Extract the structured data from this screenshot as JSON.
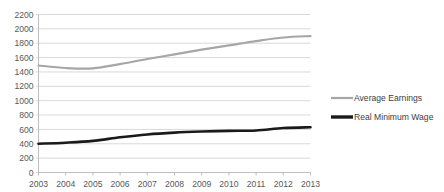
{
  "chart_data": {
    "type": "line",
    "title": "",
    "subtitle": "",
    "xlabel": "",
    "ylabel": "",
    "x": [
      2003,
      2004,
      2005,
      2006,
      2007,
      2008,
      2009,
      2010,
      2011,
      2012,
      2013
    ],
    "categories": [
      "2003",
      "2004",
      "2005",
      "2006",
      "2007",
      "2008",
      "2009",
      "2010",
      "2011",
      "2012",
      "2013"
    ],
    "series": [
      {
        "name": "Average Earnings",
        "color": "#a6a6a6",
        "values": [
          1490,
          1455,
          1450,
          1510,
          1580,
          1645,
          1710,
          1770,
          1830,
          1880,
          1900
        ]
      },
      {
        "name": "Real Minimum Wage",
        "color": "#1a1a1a",
        "values": [
          400,
          415,
          440,
          490,
          530,
          555,
          570,
          580,
          585,
          620,
          630
        ]
      }
    ],
    "ylim": [
      0,
      2200
    ],
    "ytick_step": 200,
    "ytick_labels": [
      "2200",
      "2000",
      "1800",
      "1600",
      "1400",
      "1200",
      "1000",
      "800",
      "600",
      "400",
      "200",
      "0"
    ],
    "grid": true,
    "grid_axis": "y",
    "grid_color": "#d9d9d9",
    "legend_position": "right",
    "legend": [
      {
        "label": "Average Earnings",
        "color": "#a6a6a6",
        "width": 2.2
      },
      {
        "label": "Real Minimum Wage",
        "color": "#1a1a1a",
        "width": 3.4
      }
    ],
    "background_color": "#ffffff",
    "axis_label_color": "#595959"
  }
}
